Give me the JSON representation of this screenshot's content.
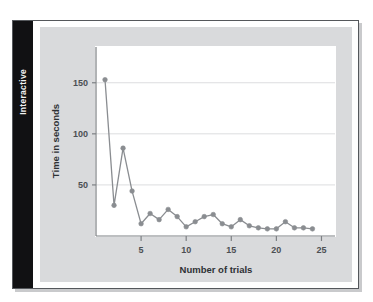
{
  "figure": {
    "tab_label": "Interactive",
    "background_color": "#d9dadc",
    "plot_background_color": "#ffffff",
    "frame_color": "#55585c",
    "tab_background_color": "#111113",
    "tab_text_color": "#f2f2f2"
  },
  "chart_data": {
    "type": "line",
    "title": "",
    "xlabel": "Number of trials",
    "ylabel": "Time in seconds",
    "xlim": [
      0,
      26.5
    ],
    "ylim": [
      0,
      185
    ],
    "xticks": [
      5,
      10,
      15,
      20,
      25
    ],
    "yticks": [
      50,
      100,
      150
    ],
    "grid": "horizontal",
    "legend": "none",
    "marker": "circle",
    "line_color": "#8a8d91",
    "marker_color": "#8a8d91",
    "x": [
      1,
      2,
      3,
      4,
      5,
      6,
      7,
      8,
      9,
      10,
      11,
      12,
      13,
      14,
      15,
      16,
      17,
      18,
      19,
      20,
      21,
      22,
      23,
      24
    ],
    "values": [
      153,
      30,
      86,
      44,
      12,
      22,
      16,
      26,
      19,
      9,
      14,
      19,
      21,
      12,
      9,
      16,
      10,
      8,
      7,
      7,
      14,
      8,
      8,
      7
    ],
    "series": [
      {
        "name": "Time to complete task",
        "values": [
          153,
          30,
          86,
          44,
          12,
          22,
          16,
          26,
          19,
          9,
          14,
          19,
          21,
          12,
          9,
          16,
          10,
          8,
          7,
          7,
          14,
          8,
          8,
          7
        ]
      }
    ]
  }
}
